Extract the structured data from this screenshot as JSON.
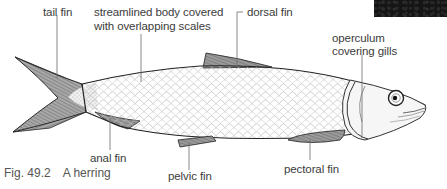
{
  "figure": {
    "number": "Fig. 49.2",
    "title": "A herring",
    "subject": "herring"
  },
  "labels": {
    "tail_fin": "tail fin",
    "body_line1": "streamlined body covered",
    "body_line2": "with overlapping scales",
    "dorsal_fin": "dorsal fin",
    "operculum_line1": "operculum",
    "operculum_line2": "covering gills",
    "anal_fin": "anal fin",
    "pelvic_fin": "pelvic fin",
    "pectoral_fin": "pectoral fin"
  },
  "colors": {
    "outline": "#2a2a2a",
    "fin_fill": "#8a8a8a",
    "scale_stroke": "#b5b5b5",
    "leader_line": "#6a6a6a",
    "text": "#3c3c3c"
  }
}
